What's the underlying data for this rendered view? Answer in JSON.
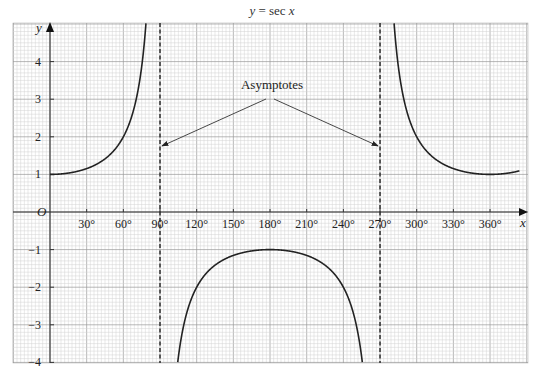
{
  "chart_data": {
    "type": "line",
    "title": "y = sec x",
    "xlabel": "x",
    "ylabel": "y",
    "origin_label": "O",
    "xlim": [
      -30,
      390
    ],
    "ylim": [
      -4,
      5.2
    ],
    "grid": true,
    "x_ticks": [
      30,
      60,
      90,
      120,
      150,
      180,
      210,
      240,
      270,
      300,
      330,
      360
    ],
    "x_tick_labels": [
      "30°",
      "60°",
      "90°",
      "120°",
      "150°",
      "180°",
      "210°",
      "240°",
      "270°",
      "300°",
      "330°",
      "360°"
    ],
    "y_ticks": [
      -4,
      -3,
      -2,
      -1,
      1,
      2,
      3,
      4
    ],
    "y_tick_labels": [
      "−4",
      "−3",
      "−2",
      "−1",
      "1",
      "2",
      "3",
      "4"
    ],
    "series": [
      {
        "name": "sec x",
        "function": "1/cos(x)",
        "x_range": [
          -30,
          384
        ],
        "x": [
          0,
          30,
          60,
          75,
          80,
          100,
          120,
          150,
          180,
          210,
          240,
          260,
          280,
          300,
          330,
          360,
          384
        ],
        "values": [
          1,
          1.15,
          2,
          3.86,
          5.76,
          -5.76,
          -2,
          -1.15,
          -1,
          -1.15,
          -2,
          -5.76,
          5.76,
          2,
          1.15,
          1,
          1.1
        ]
      }
    ],
    "asymptotes": [
      90,
      270
    ],
    "annotations": [
      {
        "text": "Asymptotes",
        "arrows_to": [
          90,
          270
        ]
      }
    ]
  },
  "labels": {
    "title_lhs": "y",
    "title_eq": " = sec ",
    "title_rhs": "x",
    "annotation": "Asymptotes"
  }
}
